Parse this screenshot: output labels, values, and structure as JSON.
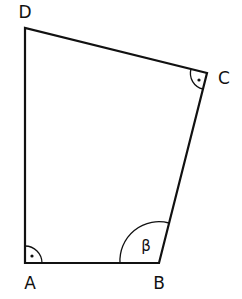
{
  "diagram": {
    "type": "quadrilateral",
    "stroke_color": "#111111",
    "vertices": [
      {
        "label": "A",
        "x": 25,
        "y": 263,
        "angle_mark": "right-angle"
      },
      {
        "label": "B",
        "x": 159,
        "y": 263,
        "angle_mark": "arc",
        "angle_label": "β"
      },
      {
        "label": "C",
        "x": 207,
        "y": 73,
        "angle_mark": "right-angle"
      },
      {
        "label": "D",
        "x": 25,
        "y": 28,
        "angle_mark": "none"
      }
    ],
    "labels": {
      "A": "A",
      "B": "B",
      "C": "C",
      "D": "D",
      "beta": "β"
    }
  }
}
